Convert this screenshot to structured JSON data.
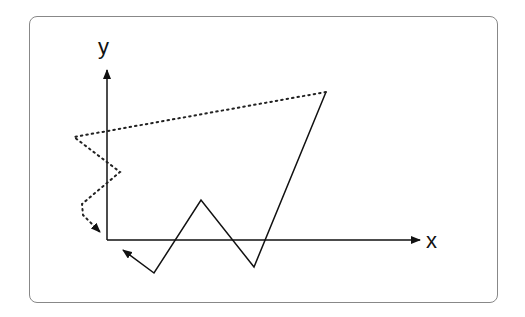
{
  "diagram": {
    "axes": {
      "x_label": "x",
      "y_label": "y",
      "origin": [
        107,
        240
      ],
      "x_end": [
        420,
        240
      ],
      "y_end": [
        107,
        70
      ]
    },
    "solid_path": {
      "style": "solid",
      "points": [
        [
          326,
          92
        ],
        [
          254,
          267
        ],
        [
          201,
          200
        ],
        [
          154,
          273
        ],
        [
          123,
          250
        ]
      ],
      "arrow_at_end": true
    },
    "dotted_path": {
      "style": "dotted",
      "points": [
        [
          326,
          92
        ],
        [
          74,
          137
        ],
        [
          120,
          172
        ],
        [
          82,
          204
        ],
        [
          83,
          215
        ],
        [
          100,
          232
        ]
      ],
      "arrow_at_end": true
    },
    "colors": {
      "stroke": "#111111",
      "frame": "#888888"
    }
  }
}
